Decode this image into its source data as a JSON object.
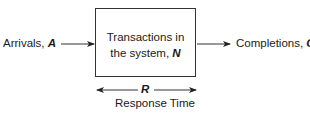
{
  "diagram": {
    "input": {
      "label": "Arrivals, ",
      "variable": "A"
    },
    "system": {
      "line1": "Transactions in",
      "line2_prefix": "the system, ",
      "variable": "N"
    },
    "output": {
      "label": "Completions, ",
      "variable": "C"
    },
    "span": {
      "variable": "R",
      "label": "Response Time"
    }
  }
}
